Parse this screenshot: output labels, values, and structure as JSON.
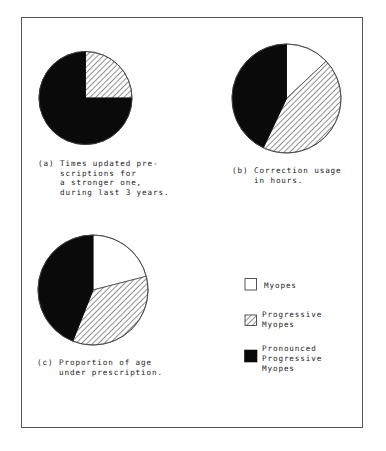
{
  "chart_data": [
    {
      "type": "pie",
      "id": "a",
      "label": "(a)",
      "caption": [
        "Times updated pre-",
        "scriptions for",
        "a stronger one,",
        "during last 3 years."
      ],
      "start_angle": "12 o'clock",
      "direction": "clockwise",
      "slices": [
        {
          "series": "Myopes",
          "value": 0
        },
        {
          "series": "Progressive Myopes",
          "value": 25
        },
        {
          "series": "Pronounced Progressive Myopes",
          "value": 75
        }
      ],
      "units": "percent"
    },
    {
      "type": "pie",
      "id": "b",
      "label": "(b)",
      "caption": [
        "Correction usage",
        "in hours."
      ],
      "start_angle": "12 o'clock",
      "direction": "clockwise",
      "slices": [
        {
          "series": "Myopes",
          "value": 13
        },
        {
          "series": "Progressive Myopes",
          "value": 44
        },
        {
          "series": "Pronounced Progressive Myopes",
          "value": 43
        }
      ],
      "units": "percent"
    },
    {
      "type": "pie",
      "id": "c",
      "label": "(c)",
      "caption": [
        "Proportion of age",
        "under prescription."
      ],
      "start_angle": "12 o'clock",
      "direction": "clockwise",
      "slices": [
        {
          "series": "Myopes",
          "value": 21
        },
        {
          "series": "Progressive Myopes",
          "value": 35
        },
        {
          "series": "Pronounced Progressive Myopes",
          "value": 44
        }
      ],
      "units": "percent"
    }
  ],
  "legend": {
    "placement": "bottom-right",
    "entries": [
      {
        "series": "Myopes",
        "fill": "white",
        "lines": [
          "Myopes"
        ]
      },
      {
        "series": "Progressive Myopes",
        "fill": "hatched",
        "lines": [
          "Progressive",
          "Myopes"
        ]
      },
      {
        "series": "Pronounced Progressive Myopes",
        "fill": "black",
        "lines": [
          "Pronounced",
          "Progressive",
          "Myopes"
        ]
      }
    ]
  },
  "colors": {
    "white": "#ffffff",
    "black": "#0a0a0a",
    "hatch_line": "#333333",
    "outline": "#444444"
  }
}
